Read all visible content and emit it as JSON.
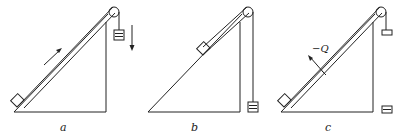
{
  "figure": {
    "panels": [
      {
        "id": "a",
        "label": "a",
        "description": "Block at bottom of incline on a belt, pulley at top, hanging weight, arrow up slope and arrow down beside weight"
      },
      {
        "id": "b",
        "label": "b",
        "description": "Block midway on incline, hanging weight lowered to ground"
      },
      {
        "id": "c",
        "label": "c",
        "description": "Block at bottom of incline, force arrow labeled -Q perpendicular to belt, small weight near pulley and box at ground"
      }
    ],
    "annotations": {
      "force_label": "−Q"
    },
    "colors": {
      "stroke": "#222222",
      "background": "#ffffff"
    }
  }
}
